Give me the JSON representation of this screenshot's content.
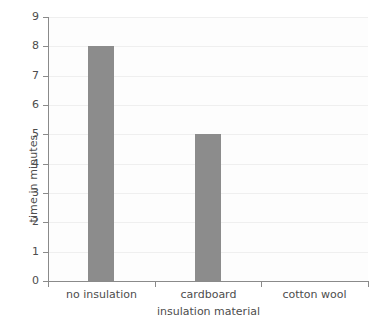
{
  "chart_data": {
    "type": "bar",
    "title": "",
    "subtitle": "",
    "xlabel": "insulation material",
    "ylabel": "time in minutes",
    "categories": [
      "no insulation",
      "cardboard",
      "cotton wool"
    ],
    "values": [
      8,
      5,
      null
    ],
    "series": [
      {
        "name": "time in minutes",
        "values": [
          8,
          5,
          null
        ]
      }
    ],
    "ylim": [
      0,
      9
    ],
    "ytick_labels": [
      "0",
      "1",
      "2",
      "3",
      "4",
      "5",
      "6",
      "7",
      "8",
      "9"
    ],
    "ytick_values": [
      0,
      1,
      2,
      3,
      4,
      5,
      6,
      7,
      8,
      9
    ],
    "grid": true,
    "grid_axis": "y",
    "legend": false,
    "legend_position": "none",
    "annotations": [],
    "bar_color": "#8c8c8c",
    "gridline_color": "#efefef",
    "axis_color": "#8a8a8a",
    "text_color": "#4d4d4d",
    "plot_background": "#fdfdfd",
    "figure_background": "#ffffff"
  }
}
